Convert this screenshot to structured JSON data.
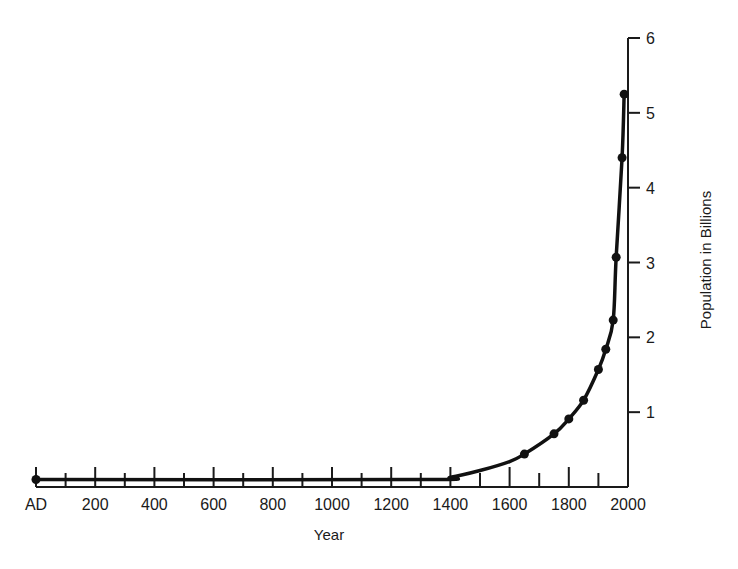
{
  "chart_data": {
    "type": "line",
    "title": "",
    "xlabel": "Year",
    "ylabel": "Population in Billions",
    "xlim": [
      0,
      2000
    ],
    "ylim": [
      0,
      6
    ],
    "grid": false,
    "legend": null,
    "x_tick_labels": [
      "AD",
      "200",
      "400",
      "600",
      "800",
      "1000",
      "1200",
      "1400",
      "1600",
      "1800",
      "2000"
    ],
    "x_tick_values": [
      0,
      200,
      400,
      600,
      800,
      1000,
      1200,
      1400,
      1600,
      1800,
      2000
    ],
    "x_minor_ticks": [
      100,
      300,
      500,
      700,
      900,
      1100,
      1300,
      1500,
      1700,
      1900
    ],
    "y_tick_labels": [
      "1",
      "2",
      "3",
      "4",
      "5",
      "6"
    ],
    "y_tick_values": [
      1,
      2,
      3,
      4,
      5,
      6
    ],
    "y_axis_position": "right",
    "series": [
      {
        "name": "World population",
        "marker": "filled-circle",
        "x": [
          0,
          1650,
          1750,
          1800,
          1850,
          1900,
          1925,
          1950,
          1960,
          1980,
          1987
        ],
        "values": [
          0.1,
          0.44,
          0.71,
          0.91,
          1.16,
          1.57,
          1.84,
          2.23,
          3.07,
          4.4,
          5.25
        ]
      }
    ]
  },
  "labels": {
    "xlabel": "Year",
    "ylabel": "Population in Billions"
  }
}
